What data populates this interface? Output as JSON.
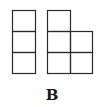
{
  "figure": {
    "label": "B",
    "line_color": "#2a2a2a",
    "shapes": [
      {
        "name": "column-of-three-squares",
        "cells": [
          [
            0,
            0
          ],
          [
            0,
            1
          ],
          [
            0,
            2
          ]
        ]
      },
      {
        "name": "l-shape-of-five-squares",
        "cells": [
          [
            0,
            0
          ],
          [
            0,
            1
          ],
          [
            1,
            1
          ],
          [
            0,
            2
          ],
          [
            1,
            2
          ]
        ]
      }
    ]
  }
}
